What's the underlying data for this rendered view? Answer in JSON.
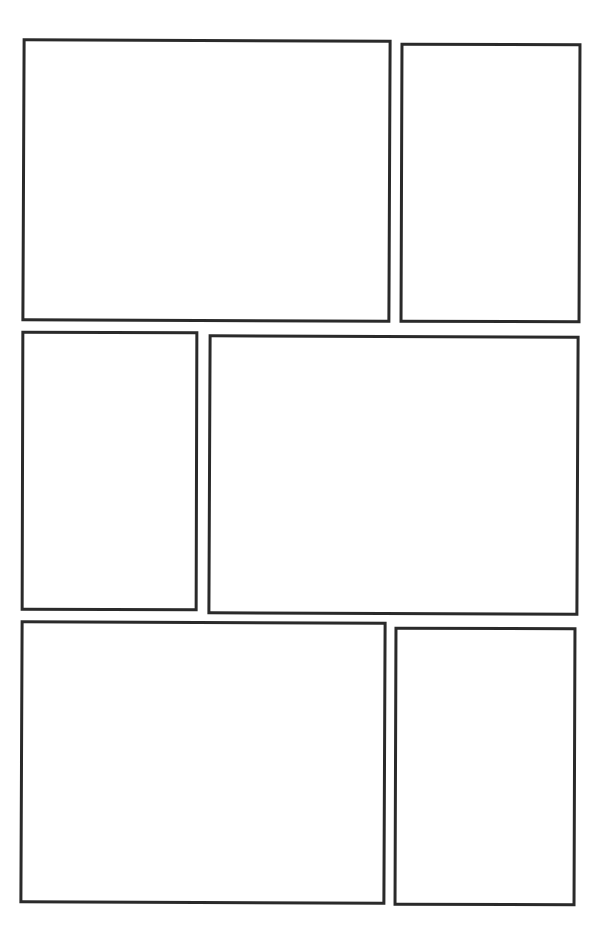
{
  "page": {
    "type": "comic-page-template",
    "background_color": "#ffffff",
    "border_color": "#2a2a2a",
    "rows": 3,
    "panels": [
      {
        "id": "p1",
        "row": 1,
        "position": "left",
        "size": "wide"
      },
      {
        "id": "p2",
        "row": 1,
        "position": "right",
        "size": "narrow"
      },
      {
        "id": "p3",
        "row": 2,
        "position": "left",
        "size": "narrow"
      },
      {
        "id": "p4",
        "row": 2,
        "position": "right",
        "size": "wide"
      },
      {
        "id": "p5",
        "row": 3,
        "position": "left",
        "size": "wide"
      },
      {
        "id": "p6",
        "row": 3,
        "position": "right",
        "size": "narrow"
      }
    ]
  }
}
